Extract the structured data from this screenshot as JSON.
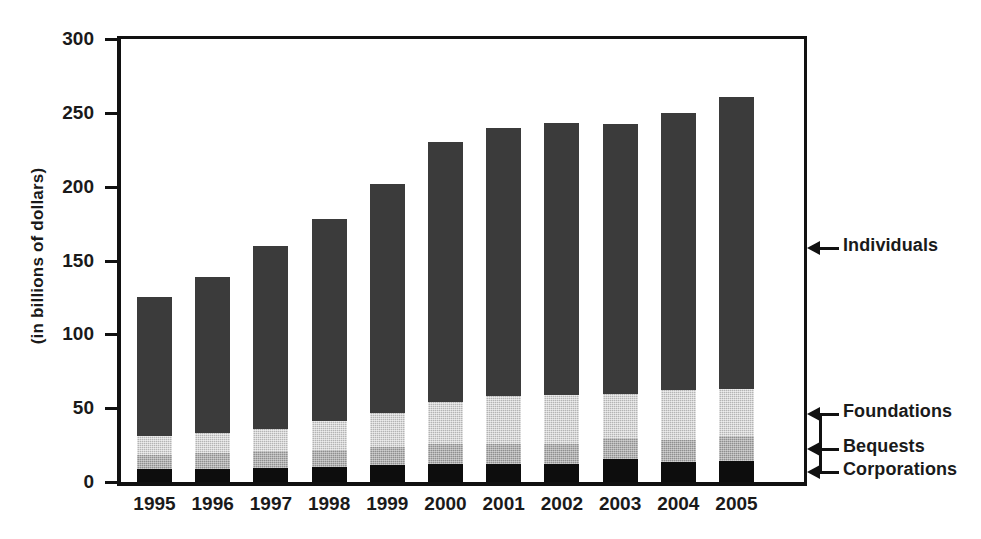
{
  "chart_data": {
    "type": "bar",
    "stacked": true,
    "title": "",
    "subtitle": "",
    "xlabel": "",
    "ylabel": "(in billions of dollars)",
    "ylim": [
      0,
      300
    ],
    "ytick_labels": [
      "300",
      "250",
      "200",
      "150",
      "100",
      "50",
      "0"
    ],
    "ytick_values": [
      300,
      250,
      200,
      150,
      100,
      50,
      0
    ],
    "grid": false,
    "legend_position": "right-callouts",
    "categories": [
      "1995",
      "1996",
      "1997",
      "1998",
      "1999",
      "2000",
      "2001",
      "2002",
      "2003",
      "2004",
      "2005"
    ],
    "series": [
      {
        "name": "Corporations",
        "color": "#0d0d0d",
        "values": [
          8.5,
          9.0,
          9.5,
          10.0,
          11.5,
          12.5,
          12.5,
          12.5,
          15.5,
          13.5,
          14.5
        ]
      },
      {
        "name": "Bequests",
        "color": "#8f8f8f",
        "values": [
          10.0,
          10.5,
          11.5,
          11.5,
          12.5,
          13.0,
          13.0,
          13.0,
          14.5,
          15.0,
          16.5
        ]
      },
      {
        "name": "Foundations",
        "color": "#b4b4b4",
        "values": [
          12.5,
          13.5,
          15.0,
          19.5,
          23.0,
          28.5,
          32.5,
          33.5,
          29.5,
          33.5,
          32.0
        ]
      },
      {
        "name": "Individuals",
        "color": "#3b3b3b",
        "values": [
          94.0,
          106.0,
          124.0,
          137.0,
          155.0,
          176.0,
          182.0,
          184.0,
          183.0,
          188.0,
          198.0
        ]
      }
    ],
    "totals": [
      125,
      139,
      160,
      178,
      202,
      230,
      240,
      243,
      243,
      250,
      261
    ],
    "annotations": [
      {
        "label": "Individuals",
        "target_series": "Individuals"
      },
      {
        "label": "Foundations",
        "target_series": "Foundations"
      },
      {
        "label": "Bequests",
        "target_series": "Bequests"
      },
      {
        "label": "Corporations",
        "target_series": "Corporations"
      }
    ]
  },
  "axis": {
    "y_title": "(in billions of dollars)"
  },
  "callouts": {
    "individuals": "Individuals",
    "foundations": "Foundations",
    "bequests": "Bequests",
    "corporations": "Corporations"
  }
}
